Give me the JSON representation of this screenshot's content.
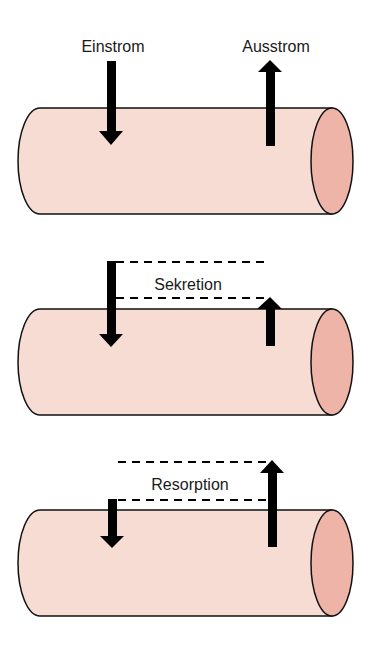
{
  "colors": {
    "body": "#f6dcd2",
    "cap": "#eeb4a8",
    "stroke": "#111111",
    "arrow": "#000000"
  },
  "panels": [
    {
      "name": "baseline",
      "labels": {
        "influx": "Einstrom",
        "efflux": "Ausstrom"
      }
    },
    {
      "name": "secretion",
      "labels": {
        "difference": "Sekretion"
      }
    },
    {
      "name": "resorption",
      "labels": {
        "difference": "Resorption"
      }
    }
  ]
}
